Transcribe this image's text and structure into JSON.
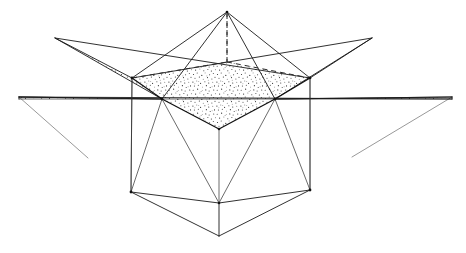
{
  "figure": {
    "caption": "",
    "background_color": "#ffffff",
    "ink_color": "#1a1a1a",
    "stipple_color": "#3a3a3a",
    "canvas": {
      "width": 466,
      "height": 253
    }
  },
  "chart_data": {
    "type": "diagram",
    "xlabel": "",
    "ylabel": "",
    "xlim": [
      0,
      466
    ],
    "ylim": [
      0,
      253
    ],
    "grid": false,
    "legend": "none",
    "annotations": [],
    "vertices": {
      "apex_top": [
        227,
        12
      ],
      "star_tip_upper_left": [
        55,
        38
      ],
      "star_tip_upper_right": [
        372,
        38
      ],
      "star_tip_far_left": [
        19,
        97
      ],
      "star_tip_far_right": [
        452,
        97
      ],
      "rim_back_left": [
        132,
        78
      ],
      "rim_back_right": [
        310,
        78
      ],
      "rim_front_left": [
        162,
        99
      ],
      "rim_front_right": [
        275,
        99
      ],
      "rim_front_center": [
        219,
        129
      ],
      "plane_left_end": [
        19,
        99
      ],
      "plane_right_end": [
        452,
        99
      ],
      "base_left": [
        131,
        192
      ],
      "base_right": [
        310,
        190
      ],
      "base_front_center": [
        219,
        203
      ],
      "base_bottom_apex": [
        219,
        236
      ],
      "drop_left_end": [
        88,
        158
      ],
      "drop_right_end": [
        352,
        157
      ],
      "hidden_back_center": [
        227,
        62
      ]
    },
    "edge_groups": [
      {
        "name": "upper-pyramid-edges",
        "style": "solid",
        "segments": [
          [
            "apex_top",
            "rim_back_left"
          ],
          [
            "apex_top",
            "rim_back_right"
          ],
          [
            "apex_top",
            "rim_front_left"
          ],
          [
            "apex_top",
            "rim_front_right"
          ]
        ]
      },
      {
        "name": "hidden-construction-lines",
        "style": "dashed",
        "segments": [
          [
            "apex_top",
            "hidden_back_center"
          ],
          [
            "rim_back_left",
            "hidden_back_center"
          ],
          [
            "hidden_back_center",
            "rim_back_right"
          ]
        ]
      },
      {
        "name": "upper-rim",
        "style": "heavy",
        "segments": [
          [
            "rim_back_left",
            "rim_front_left"
          ],
          [
            "rim_front_left",
            "rim_front_center"
          ],
          [
            "rim_front_center",
            "rim_front_right"
          ],
          [
            "rim_front_right",
            "rim_back_right"
          ]
        ]
      },
      {
        "name": "star-plane-outline",
        "style": "solid",
        "segments": [
          [
            "star_tip_upper_left",
            "rim_back_left"
          ],
          [
            "star_tip_upper_left",
            "rim_front_left"
          ],
          [
            "star_tip_far_left",
            "rim_front_left"
          ],
          [
            "star_tip_upper_right",
            "rim_back_right"
          ],
          [
            "star_tip_upper_right",
            "rim_front_right"
          ],
          [
            "star_tip_far_right",
            "rim_front_right"
          ],
          [
            "star_tip_far_left",
            "plane_right_end"
          ]
        ]
      },
      {
        "name": "antiprism-side-edges",
        "style": "thin",
        "segments": [
          [
            "rim_back_left",
            "base_left"
          ],
          [
            "rim_back_right",
            "base_right"
          ],
          [
            "rim_front_left",
            "base_left"
          ],
          [
            "rim_front_right",
            "base_right"
          ],
          [
            "rim_front_left",
            "base_front_center"
          ],
          [
            "rim_front_right",
            "base_front_center"
          ],
          [
            "rim_front_center",
            "base_front_center"
          ]
        ]
      },
      {
        "name": "base-edges",
        "style": "solid",
        "segments": [
          [
            "base_left",
            "base_front_center"
          ],
          [
            "base_front_center",
            "base_right"
          ],
          [
            "base_left",
            "base_bottom_apex"
          ],
          [
            "base_right",
            "base_bottom_apex"
          ],
          [
            "base_front_center",
            "base_bottom_apex"
          ]
        ]
      },
      {
        "name": "faint-drop-lines",
        "style": "faint",
        "segments": [
          [
            "star_tip_far_left",
            "drop_left_end"
          ],
          [
            "star_tip_far_right",
            "drop_right_end"
          ]
        ]
      }
    ],
    "shaded_regions": [
      {
        "name": "star-plane-stipple",
        "fill": "stipple",
        "polygon_sets": [
          [
            "star_tip_far_left",
            "plane_left_end",
            "plane_right_end",
            "star_tip_far_right",
            "rim_front_right",
            "star_tip_upper_right",
            "rim_back_right",
            "hidden_back_center",
            "rim_back_left",
            "star_tip_upper_left",
            "rim_front_left"
          ]
        ]
      },
      {
        "name": "front-rim-stipple",
        "fill": "stipple",
        "polygon_sets": [
          [
            "rim_front_left",
            "rim_front_center",
            "rim_front_right",
            "plane_right_end",
            "plane_left_end"
          ]
        ]
      }
    ],
    "vertex_markers": [
      "rim_back_left",
      "rim_back_right",
      "rim_front_left",
      "rim_front_right",
      "rim_front_center",
      "base_left",
      "base_right",
      "base_front_center"
    ]
  }
}
